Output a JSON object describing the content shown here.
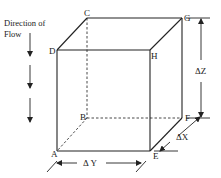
{
  "diagram": {
    "flow_label_line1": "Direction of",
    "flow_label_line2": "Flow",
    "vertices": {
      "A": "A",
      "B": "B",
      "C": "C",
      "D": "D",
      "E": "E",
      "F": "F",
      "G": "G",
      "H": "H"
    },
    "dimensions": {
      "dx": "ΔX",
      "dy": "Δ Y",
      "dz": "ΔZ"
    },
    "colors": {
      "line": "#222222",
      "background": "#ffffff"
    }
  }
}
